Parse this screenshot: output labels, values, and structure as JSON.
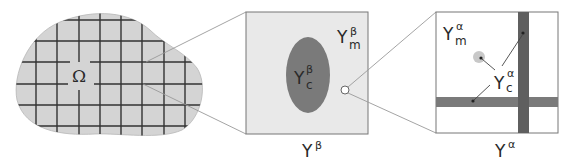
{
  "diagram": {
    "macro": {
      "label": "Ω",
      "fill": "#d4d4d4",
      "grid_color": "#333333"
    },
    "meso_cell": {
      "label": "Y",
      "label_sup": "β",
      "matrix_label": "Y",
      "matrix_sub": "m",
      "matrix_sup": "β",
      "inclusion_label": "Y",
      "inclusion_sub": "c",
      "inclusion_sup": "β",
      "fill": "#e9e9e9",
      "inclusion_fill": "#7a7a7a"
    },
    "micro_cell": {
      "label": "Y",
      "label_sup": "α",
      "matrix_label": "Y",
      "matrix_sub": "m",
      "matrix_sup": "α",
      "inclusion_label": "Y",
      "inclusion_sub": "c",
      "inclusion_sup": "α",
      "fill": "#ffffff",
      "fiber_fill": "#6f6f6f"
    },
    "connector_color": "#9a9a9a"
  }
}
